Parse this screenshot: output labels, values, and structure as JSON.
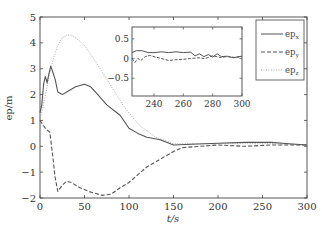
{
  "chart_data": {
    "type": "line",
    "title": "",
    "xlabel": "t/s",
    "ylabel": "ep/m",
    "xlim": [
      0,
      300
    ],
    "ylim": [
      -2,
      5
    ],
    "xticks": [
      0,
      50,
      100,
      150,
      200,
      250,
      300
    ],
    "yticks": [
      -2,
      -1,
      0,
      1,
      2,
      3,
      4,
      5
    ],
    "grid": false,
    "legend_position": "upper right",
    "series": [
      {
        "name": "ep_x",
        "style": "solid",
        "color": "#555555",
        "x": [
          0,
          2,
          4,
          6,
          8,
          10,
          12,
          14,
          17,
          20,
          25,
          30,
          40,
          50,
          57,
          65,
          75,
          90,
          100,
          110,
          120,
          135,
          150,
          170,
          200,
          230,
          260,
          280,
          300
        ],
        "y": [
          1.3,
          1.6,
          2.4,
          2.7,
          2.45,
          2.8,
          3.1,
          2.9,
          2.6,
          2.1,
          2.0,
          2.1,
          2.3,
          2.4,
          2.3,
          2.0,
          1.6,
          1.2,
          0.7,
          0.5,
          0.35,
          0.25,
          0.05,
          0.08,
          0.12,
          0.15,
          0.15,
          0.1,
          0.05
        ]
      },
      {
        "name": "ep_y",
        "style": "dashed",
        "color": "#555555",
        "x": [
          0,
          3,
          6,
          9,
          11,
          14,
          17,
          20,
          25,
          30,
          35,
          45,
          55,
          70,
          80,
          90,
          100,
          110,
          120,
          130,
          140,
          150,
          160,
          180,
          200,
          230,
          260,
          280,
          300
        ],
        "y": [
          1.0,
          0.85,
          0.7,
          0.6,
          0.55,
          -0.3,
          -1.2,
          -1.75,
          -1.5,
          -1.35,
          -1.4,
          -1.6,
          -1.75,
          -1.9,
          -1.85,
          -1.6,
          -1.4,
          -1.1,
          -0.8,
          -0.6,
          -0.4,
          -0.2,
          -0.05,
          0.0,
          0.05,
          0.0,
          0.05,
          0.05,
          0.05
        ]
      },
      {
        "name": "ep_z",
        "style": "dotted",
        "color": "#aaaaaa",
        "x": [
          0,
          5,
          10,
          15,
          20,
          25,
          30,
          35,
          40,
          50,
          60,
          75,
          95,
          112,
          130,
          150,
          170,
          200,
          230,
          260,
          300
        ],
        "y": [
          1.0,
          1.8,
          2.7,
          3.4,
          3.9,
          4.2,
          4.3,
          4.3,
          4.2,
          3.9,
          3.4,
          2.6,
          1.5,
          0.8,
          0.35,
          0.1,
          0.1,
          0.1,
          0.1,
          0.1,
          0.05
        ]
      }
    ],
    "inset": {
      "xlim": [
        225,
        300
      ],
      "ylim": [
        -0.95,
        0.8
      ],
      "xticks": [
        240,
        260,
        280,
        300
      ],
      "yticks": [
        -0.5,
        0,
        0.5
      ],
      "series": [
        {
          "name": "ep_x",
          "style": "solid",
          "x": [
            225,
            228,
            232,
            236,
            240,
            245,
            250,
            255,
            260,
            265,
            268,
            271,
            274,
            277,
            280,
            283,
            286,
            290,
            294,
            298,
            300
          ],
          "y": [
            0.15,
            0.2,
            0.2,
            0.15,
            0.15,
            0.17,
            0.15,
            0.17,
            0.15,
            0.16,
            0.07,
            0.12,
            0.05,
            0.1,
            0.04,
            0.12,
            0.05,
            0.06,
            0.02,
            0.05,
            0.06
          ]
        },
        {
          "name": "ep_y",
          "style": "dashed",
          "x": [
            225,
            227,
            229,
            231,
            234,
            237,
            240,
            245,
            250,
            255,
            260,
            265,
            270,
            275,
            280,
            285,
            290,
            295,
            300
          ],
          "y": [
            0.0,
            -0.1,
            0.0,
            -0.05,
            0.05,
            0.08,
            0.05,
            0.0,
            -0.05,
            -0.03,
            -0.02,
            0.0,
            0.02,
            0.0,
            0.07,
            0.03,
            0.05,
            0.03,
            0.05
          ]
        }
      ]
    }
  },
  "labels": {
    "xlabel": "t/s",
    "ylabel": "ep/m",
    "legend": [
      {
        "base": "ep",
        "sub": "x"
      },
      {
        "base": "ep",
        "sub": "y"
      },
      {
        "base": "ep",
        "sub": "z"
      }
    ]
  }
}
